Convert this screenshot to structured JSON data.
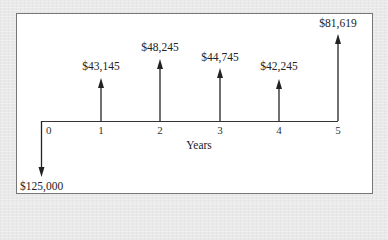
{
  "diagram": {
    "type": "cash-flow-diagram",
    "axis_label": "Years",
    "ticks": [
      "0",
      "1",
      "2",
      "3",
      "4",
      "5"
    ],
    "cash_flows": [
      {
        "year": 0,
        "direction": "down",
        "label": "$125,000",
        "amount": -125000
      },
      {
        "year": 1,
        "direction": "up",
        "label": "$43,145",
        "amount": 43145
      },
      {
        "year": 2,
        "direction": "up",
        "label": "$48,245",
        "amount": 48245
      },
      {
        "year": 3,
        "direction": "up",
        "label": "$44,745",
        "amount": 44745
      },
      {
        "year": 4,
        "direction": "up",
        "label": "$42,245",
        "amount": 42245
      },
      {
        "year": 5,
        "direction": "up",
        "label": "$81,619",
        "amount": 81619
      }
    ],
    "colors": {
      "background": "#e9e9e9",
      "panel": "#ffffff",
      "border": "#777777",
      "line": "#222222"
    }
  }
}
